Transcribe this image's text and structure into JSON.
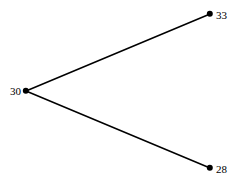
{
  "diagram": {
    "background_color": "#ffffff",
    "node_color": "#000000",
    "edge_color": "#000000",
    "label_color": "#000000",
    "canvas": {
      "width": 236,
      "height": 180
    },
    "nodes": [
      {
        "id": "root",
        "label": "30",
        "x": 26,
        "y": 91,
        "radius": 3.2,
        "label_side": "left",
        "label_x": 21,
        "label_y": 91
      },
      {
        "id": "upper",
        "label": "33",
        "x": 210,
        "y": 14,
        "radius": 3.2,
        "label_side": "right",
        "label_x": 216,
        "label_y": 15
      },
      {
        "id": "lower",
        "label": "28",
        "x": 210,
        "y": 168,
        "radius": 3.2,
        "label_side": "right",
        "label_x": 216,
        "label_y": 169
      }
    ],
    "edges": [
      {
        "id": "edge-root-upper",
        "from": "root",
        "to": "upper",
        "x1": 26,
        "y1": 91,
        "x2": 210,
        "y2": 14,
        "width": 1.5
      },
      {
        "id": "edge-root-lower",
        "from": "root",
        "to": "lower",
        "x1": 26,
        "y1": 91,
        "x2": 210,
        "y2": 168,
        "width": 1.5
      }
    ]
  },
  "chart_data": {
    "type": "diagram",
    "title": "",
    "nodes": [
      {
        "label": "30",
        "value": 30,
        "position": "left-center"
      },
      {
        "label": "33",
        "value": 33,
        "position": "top-right"
      },
      {
        "label": "28",
        "value": 28,
        "position": "bottom-right"
      }
    ],
    "links": [
      {
        "source": "30",
        "target": "33"
      },
      {
        "source": "30",
        "target": "28"
      }
    ]
  }
}
